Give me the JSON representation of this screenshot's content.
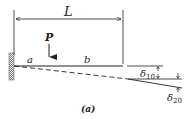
{
  "diagram": {
    "type": "cantilever-beam-deflection",
    "caption": "(a)",
    "labels": {
      "length": "L",
      "load": "P",
      "segment_a": "a",
      "segment_b": "b",
      "delta_10": "δ",
      "delta_10_sub": "10",
      "delta_20": "δ",
      "delta_20_sub": "20"
    },
    "colors": {
      "line": "#222222",
      "hatch": "#555555",
      "background": "#ffffff"
    }
  }
}
